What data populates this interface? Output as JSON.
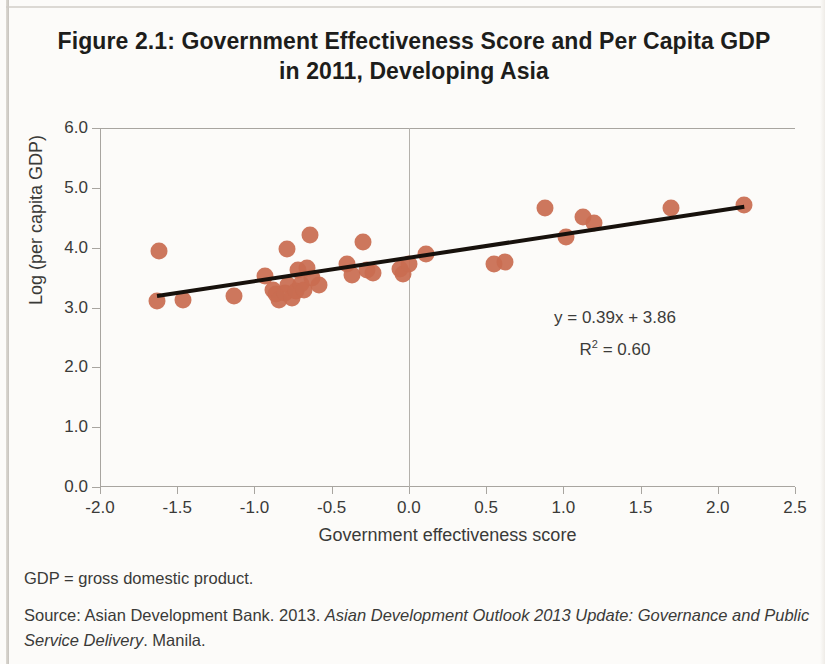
{
  "figure": {
    "title_line1": "Figure 2.1: Government Effectiveness Score and Per Capita GDP",
    "title_line2": "in 2011, Developing Asia"
  },
  "notes": {
    "abbreviation": "GDP = gross domestic product.",
    "source_prefix": "Source: Asian Development Bank. 2013. ",
    "source_italic": "Asian Development Outlook 2013 Update: Governance and Public Service Delivery",
    "source_suffix": ". Manila."
  },
  "colors": {
    "marker": "#c96d51",
    "trendline": "#17110c",
    "axis": "#a8a5a0",
    "text": "#3a3a38"
  },
  "chart_data": {
    "type": "scatter",
    "title": "Figure 2.1: Government Effectiveness Score and Per Capita GDP in 2011, Developing Asia",
    "xlabel": "Government effectiveness  score",
    "ylabel": "Log (per capita GDP)",
    "xlim": [
      -2.0,
      2.5
    ],
    "ylim": [
      0.0,
      6.0
    ],
    "xticks": [
      -2.0,
      -1.5,
      -1.0,
      -0.5,
      0.0,
      0.5,
      1.0,
      1.5,
      2.0,
      2.5
    ],
    "xticklabels": [
      "-2.0",
      "-1.5",
      "-1.0",
      "-0.5",
      "0.0",
      "0.5",
      "1.0",
      "1.5",
      "2.0",
      "2.5"
    ],
    "yticks": [
      0.0,
      1.0,
      2.0,
      3.0,
      4.0,
      5.0,
      6.0
    ],
    "yticklabels": [
      "0.0",
      "1.0",
      "2.0",
      "3.0",
      "4.0",
      "5.0",
      "6.0"
    ],
    "grid": false,
    "legend": "none",
    "zero_vline_x": 0.0,
    "annotations": {
      "equation": "y = 0.39x + 3.86",
      "r_squared_label": "R",
      "r_squared_exponent": "2",
      "r_squared_value": " = 0.60"
    },
    "trendline": {
      "slope": 0.39,
      "intercept": 3.86,
      "r_squared": 0.6,
      "x_start": -1.63,
      "y_start": 3.22,
      "x_end": 2.17,
      "y_end": 4.71
    },
    "points": [
      {
        "x": -1.62,
        "y": 3.95
      },
      {
        "x": -1.63,
        "y": 3.11
      },
      {
        "x": -1.46,
        "y": 3.13
      },
      {
        "x": -1.13,
        "y": 3.19
      },
      {
        "x": -0.93,
        "y": 3.52
      },
      {
        "x": -0.88,
        "y": 3.3
      },
      {
        "x": -0.86,
        "y": 3.22
      },
      {
        "x": -0.84,
        "y": 3.12
      },
      {
        "x": -0.8,
        "y": 3.25
      },
      {
        "x": -0.79,
        "y": 3.97
      },
      {
        "x": -0.78,
        "y": 3.37
      },
      {
        "x": -0.76,
        "y": 3.16
      },
      {
        "x": -0.73,
        "y": 3.27
      },
      {
        "x": -0.72,
        "y": 3.62
      },
      {
        "x": -0.7,
        "y": 3.4
      },
      {
        "x": -0.68,
        "y": 3.3
      },
      {
        "x": -0.66,
        "y": 3.66
      },
      {
        "x": -0.64,
        "y": 4.22
      },
      {
        "x": -0.63,
        "y": 3.5
      },
      {
        "x": -0.58,
        "y": 3.38
      },
      {
        "x": -0.4,
        "y": 3.72
      },
      {
        "x": -0.37,
        "y": 3.55
      },
      {
        "x": -0.3,
        "y": 4.1
      },
      {
        "x": -0.27,
        "y": 3.62
      },
      {
        "x": -0.23,
        "y": 3.57
      },
      {
        "x": -0.06,
        "y": 3.65
      },
      {
        "x": -0.04,
        "y": 3.56
      },
      {
        "x": 0.0,
        "y": 3.72
      },
      {
        "x": 0.11,
        "y": 3.89
      },
      {
        "x": 0.55,
        "y": 3.72
      },
      {
        "x": 0.62,
        "y": 3.76
      },
      {
        "x": 0.88,
        "y": 4.67
      },
      {
        "x": 1.02,
        "y": 4.18
      },
      {
        "x": 1.13,
        "y": 4.52
      },
      {
        "x": 1.2,
        "y": 4.42
      },
      {
        "x": 1.7,
        "y": 4.66
      },
      {
        "x": 2.17,
        "y": 4.72
      }
    ]
  }
}
